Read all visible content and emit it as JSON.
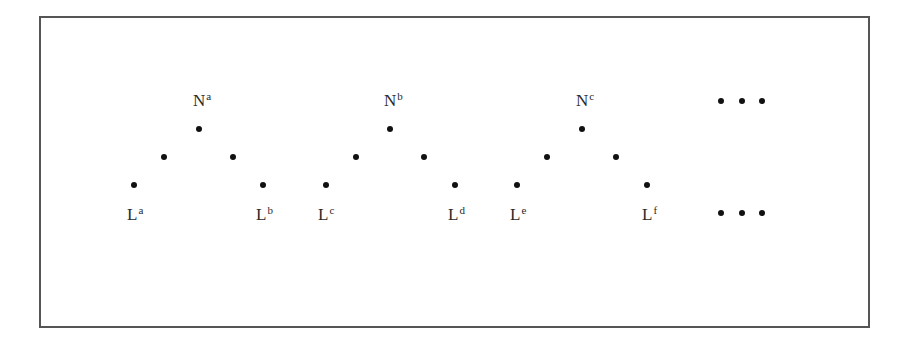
{
  "diagram": {
    "trees": [
      {
        "root_label": {
          "base": "N",
          "sup": "a"
        },
        "left_leaf_label": {
          "base": "L",
          "sup": "a"
        },
        "right_leaf_label": {
          "base": "L",
          "sup": "b"
        }
      },
      {
        "root_label": {
          "base": "N",
          "sup": "b"
        },
        "left_leaf_label": {
          "base": "L",
          "sup": "c"
        },
        "right_leaf_label": {
          "base": "L",
          "sup": "d"
        }
      },
      {
        "root_label": {
          "base": "N",
          "sup": "c"
        },
        "left_leaf_label": {
          "base": "L",
          "sup": "e"
        },
        "right_leaf_label": {
          "base": "L",
          "sup": "f"
        }
      }
    ],
    "continuation_top": "• • •",
    "continuation_bottom": "• • •",
    "colors": {
      "border": "#555555",
      "dot": "#111111",
      "text": "#2a2a2a",
      "background": "#ffffff"
    }
  }
}
